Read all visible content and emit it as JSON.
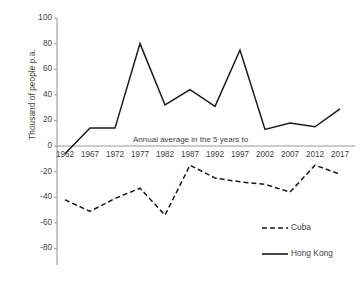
{
  "chart_data": {
    "type": "line",
    "title": "",
    "xlabel": "",
    "ylabel": "Thousand of people p.a.",
    "annotation": "Annual average in the 5 years to",
    "categories": [
      "1962",
      "1967",
      "1972",
      "1977",
      "1982",
      "1987",
      "1992",
      "1997",
      "2002",
      "2007",
      "2012",
      "2017"
    ],
    "yticks": [
      "100",
      "80",
      "60",
      "40",
      "20",
      "0",
      "-20",
      "-40",
      "-60",
      "-80"
    ],
    "ylim": [
      -80,
      100
    ],
    "grid": false,
    "legend_position": "bottom-right",
    "series": [
      {
        "name": "Cuba",
        "style": "dashed",
        "color": "#1a1a1a",
        "values": [
          -42,
          -51,
          -41,
          -33,
          -54,
          -15,
          -25,
          -28,
          -30,
          -36,
          -15,
          -22
        ]
      },
      {
        "name": "Hong Kong",
        "style": "solid",
        "color": "#1a1a1a",
        "values": [
          -6,
          14,
          14,
          80,
          32,
          44,
          31,
          75,
          13,
          18,
          15,
          29
        ]
      }
    ]
  }
}
